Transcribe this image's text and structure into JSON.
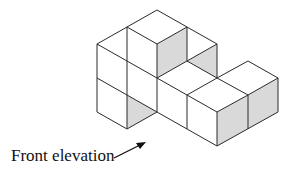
{
  "figure": {
    "type": "isometric-cube-solid",
    "caption": "Front elevation",
    "colors": {
      "stroke": "#2a2a2a",
      "face": "#ffffff",
      "shaded": "#d9d9d9"
    },
    "arrow": {
      "from": [
        114,
        158
      ],
      "to": [
        146,
        142
      ]
    }
  }
}
